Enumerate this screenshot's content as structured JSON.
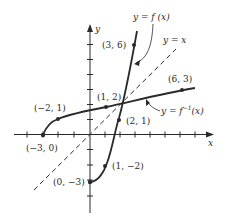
{
  "figure": {
    "axes": {
      "x_label": "x",
      "y_label": "y",
      "origin_px": [
        90,
        134.5
      ],
      "unit_px": 15,
      "x_ticks": [
        -4,
        -3,
        -2,
        -1,
        1,
        2,
        3,
        4,
        5,
        6,
        7
      ],
      "y_ticks": [
        -5,
        -4,
        -3,
        -2,
        -1,
        1,
        2,
        3,
        4,
        5,
        6
      ]
    },
    "curves": {
      "f": {
        "label": "y = f (x)"
      },
      "f_inverse": {
        "label_prefix": "y = f",
        "label_sup": "−1",
        "label_suffix": "(x)"
      },
      "identity": {
        "label": "y = x"
      }
    },
    "points": [
      {
        "label": "(3, 6)",
        "curve": "f"
      },
      {
        "label": "(1, 2)",
        "curve": "f_inverse"
      },
      {
        "label": "(2, 1)",
        "curve": "f"
      },
      {
        "label": "(−2, 1)",
        "curve": "f_inverse"
      },
      {
        "label": "(6, 3)",
        "curve": "f_inverse"
      },
      {
        "label": "(−3, 0)",
        "curve": "f_inverse"
      },
      {
        "label": "(1, −2)",
        "curve": "f"
      },
      {
        "label": "(0, −3)",
        "curve": "f"
      }
    ],
    "colors": {
      "ink": "#2a2a2a",
      "background": "#ffffff"
    }
  }
}
